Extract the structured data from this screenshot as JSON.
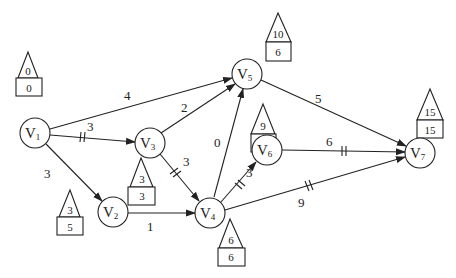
{
  "diagram": {
    "type": "network-graph",
    "nodes": [
      {
        "id": "V1",
        "label": "V",
        "sub": "1",
        "x": 35,
        "y": 133,
        "early": "0",
        "late": "0",
        "tag_x": 28,
        "tag_y": 72
      },
      {
        "id": "V2",
        "label": "V",
        "sub": "2",
        "x": 113,
        "y": 212,
        "early": "3",
        "late": "5",
        "tag_x": 77,
        "tag_y": 188
      },
      {
        "id": "V3",
        "label": "V",
        "sub": "3",
        "x": 150,
        "y": 143,
        "early": "3",
        "late": "3",
        "tag_x": 141,
        "tag_y": 175
      },
      {
        "id": "V4",
        "label": "V",
        "sub": "4",
        "x": 210,
        "y": 212,
        "early": "6",
        "late": "6",
        "tag_x": 230,
        "tag_y": 237
      },
      {
        "id": "V5",
        "label": "V",
        "sub": "5",
        "x": 247,
        "y": 74,
        "early": "10",
        "late": "6",
        "tag_x": 278,
        "tag_y": 14
      },
      {
        "id": "V6",
        "label": "V",
        "sub": "6",
        "x": 267,
        "y": 152,
        "early": "9",
        "late": "9",
        "tag_x": 263,
        "tag_y": 105
      },
      {
        "id": "V7",
        "label": "V",
        "sub": "7",
        "x": 420,
        "y": 152,
        "early": "15",
        "late": "15",
        "tag_x": 430,
        "tag_y": 90
      }
    ],
    "edges": [
      {
        "from": "V1",
        "to": "V5",
        "weight": "4",
        "critical": false
      },
      {
        "from": "V1",
        "to": "V3",
        "weight": "3",
        "critical": true
      },
      {
        "from": "V1",
        "to": "V2",
        "weight": "3",
        "critical": false
      },
      {
        "from": "V3",
        "to": "V5",
        "weight": "2",
        "critical": false
      },
      {
        "from": "V3",
        "to": "V4",
        "weight": "3",
        "critical": true
      },
      {
        "from": "V2",
        "to": "V4",
        "weight": "1",
        "critical": false
      },
      {
        "from": "V4",
        "to": "V5",
        "weight": "0",
        "critical": false
      },
      {
        "from": "V4",
        "to": "V6",
        "weight": "3",
        "critical": true
      },
      {
        "from": "V4",
        "to": "V7",
        "weight": "9",
        "critical": true
      },
      {
        "from": "V5",
        "to": "V7",
        "weight": "5",
        "critical": false
      },
      {
        "from": "V6",
        "to": "V7",
        "weight": "6",
        "critical": true
      }
    ]
  },
  "labels": {
    "v1": {
      "main": "V",
      "sub": "1",
      "early": "0",
      "late": "0"
    },
    "v2": {
      "main": "V",
      "sub": "2",
      "early": "3",
      "late": "5"
    },
    "v3": {
      "main": "V",
      "sub": "3",
      "early": "3",
      "late": "3"
    },
    "v4": {
      "main": "V",
      "sub": "4",
      "early": "6",
      "late": "6"
    },
    "v5": {
      "main": "V",
      "sub": "5",
      "early": "10",
      "late": "6"
    },
    "v6": {
      "main": "V",
      "sub": "6",
      "early": "9",
      "late": "9"
    },
    "v7": {
      "main": "V",
      "sub": "7",
      "early": "15",
      "late": "15"
    },
    "w": {
      "v1_v5": "4",
      "v1_v3": "3",
      "v1_v2": "3",
      "v3_v5": "2",
      "v3_v4": "3",
      "v2_v4": "1",
      "v4_v5": "0",
      "v4_v6": "3",
      "v4_v7": "9",
      "v5_v7": "5",
      "v6_v7": "6"
    }
  }
}
